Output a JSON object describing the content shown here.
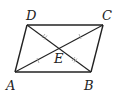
{
  "figure": {
    "type": "parallelogram-with-diagonals",
    "stroke_color": "#222222",
    "tick_color": "#888888",
    "vertices": {
      "A": {
        "label": "A",
        "x": 15,
        "y": 72
      },
      "B": {
        "label": "B",
        "x": 91,
        "y": 72
      },
      "C": {
        "label": "C",
        "x": 103,
        "y": 25
      },
      "D": {
        "label": "D",
        "x": 27,
        "y": 25
      },
      "E": {
        "label": "E",
        "x": 59,
        "y": 48
      }
    },
    "labels": {
      "A": "A",
      "B": "B",
      "C": "C",
      "D": "D",
      "E": "E"
    },
    "segments": [
      "AB",
      "BC",
      "CD",
      "DA",
      "AC",
      "BD"
    ],
    "congruence_marks": {
      "AE_EC": "single tick",
      "DE_EB": "double tick"
    }
  }
}
